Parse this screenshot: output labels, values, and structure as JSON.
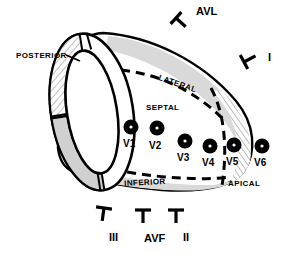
{
  "diagram": {
    "type": "anatomic-schematic",
    "colors": {
      "outline": "#000000",
      "fill_white": "#ffffff",
      "band_gray": "#d9d9d9",
      "hatch_gray": "#b8b8b8",
      "electrode": "#000000",
      "electrode_center": "#ffffff"
    }
  },
  "regions": [
    {
      "key": "posterior",
      "label": "POSTERIOR",
      "x": 16,
      "y": 52,
      "rotate": 0
    },
    {
      "key": "lateral",
      "label": "LATERAL",
      "x": 160,
      "y": 74,
      "rotate": 19
    },
    {
      "key": "septal",
      "label": "SEPTAL",
      "x": 146,
      "y": 104,
      "rotate": 0
    },
    {
      "key": "inferior",
      "label": "INFERIOR",
      "x": 124,
      "y": 180,
      "rotate": -3
    },
    {
      "key": "apical",
      "label": "APICAL",
      "x": 228,
      "y": 180,
      "rotate": 0
    }
  ],
  "electrodes": [
    {
      "label": "V1",
      "cx": 131,
      "cy": 127,
      "lx": 123,
      "ly": 139
    },
    {
      "label": "V2",
      "cx": 157,
      "cy": 128,
      "lx": 149,
      "ly": 141
    },
    {
      "label": "V3",
      "cx": 185,
      "cy": 141,
      "lx": 177,
      "ly": 153
    },
    {
      "label": "V4",
      "cx": 210,
      "cy": 146,
      "lx": 202,
      "ly": 158
    },
    {
      "label": "V5",
      "cx": 234,
      "cy": 145,
      "lx": 226,
      "ly": 157
    },
    {
      "label": "V6",
      "cx": 262,
      "cy": 146,
      "lx": 254,
      "ly": 158
    }
  ],
  "leads": [
    {
      "label": "AVL",
      "tx": 196,
      "ty": 6,
      "mx": 176,
      "my": 18,
      "rotate": -48
    },
    {
      "label": "I",
      "tx": 268,
      "ty": 52,
      "mx": 244,
      "my": 62,
      "rotate": -118
    },
    {
      "label": "III",
      "tx": 109,
      "ty": 232,
      "mx": 104,
      "my": 208,
      "rotate": 8
    },
    {
      "label": "AVF",
      "tx": 144,
      "ty": 233,
      "mx": 143,
      "my": 210,
      "rotate": 0
    },
    {
      "label": "II",
      "tx": 183,
      "ty": 232,
      "mx": 176,
      "my": 210,
      "rotate": 0
    }
  ]
}
